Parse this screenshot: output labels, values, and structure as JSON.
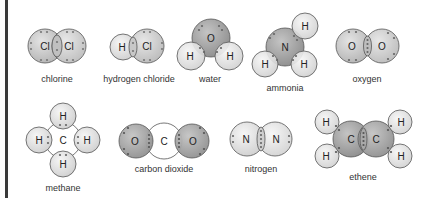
{
  "colors": {
    "light_atom": "#e2e2e2",
    "mid_atom": "#c8c8c8",
    "dark_atom": "#9e9e9e",
    "outline": "#555555",
    "electron": "#666666",
    "border_bar": "#3a3a3a"
  },
  "molecules": [
    {
      "name": "chlorine",
      "atoms": [
        "Cl",
        "Cl"
      ]
    },
    {
      "name": "hydrogen chloride",
      "atoms": [
        "H",
        "Cl"
      ]
    },
    {
      "name": "water",
      "atoms": [
        "O",
        "H",
        "H"
      ]
    },
    {
      "name": "ammonia",
      "atoms": [
        "N",
        "H",
        "H",
        "H"
      ]
    },
    {
      "name": "oxygen",
      "atoms": [
        "O",
        "O"
      ]
    },
    {
      "name": "methane",
      "atoms": [
        "C",
        "H",
        "H",
        "H",
        "H"
      ]
    },
    {
      "name": "carbon dioxide",
      "atoms": [
        "O",
        "C",
        "O"
      ]
    },
    {
      "name": "nitrogen",
      "atoms": [
        "N",
        "N"
      ]
    },
    {
      "name": "ethene",
      "atoms": [
        "C",
        "C",
        "H",
        "H",
        "H",
        "H"
      ]
    }
  ]
}
